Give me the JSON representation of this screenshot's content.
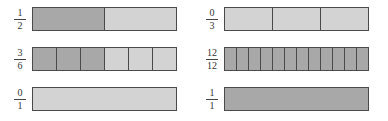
{
  "colors": {
    "shaded": "#a8a8a8",
    "unshaded": "#d3d3d3",
    "border": "#4a4a4a"
  },
  "fractions": [
    {
      "id": "one-half",
      "numerator": "1",
      "denominator": "2",
      "parts": 2,
      "shaded": 1,
      "col": 0,
      "row": 0
    },
    {
      "id": "zero-thirds",
      "numerator": "0",
      "denominator": "3",
      "parts": 3,
      "shaded": 0,
      "col": 1,
      "row": 0
    },
    {
      "id": "three-sixths",
      "numerator": "3",
      "denominator": "6",
      "parts": 6,
      "shaded": 3,
      "col": 0,
      "row": 1
    },
    {
      "id": "twelve-twelfths",
      "numerator": "12",
      "denominator": "12",
      "parts": 12,
      "shaded": 12,
      "col": 1,
      "row": 1
    },
    {
      "id": "zero-ones",
      "numerator": "0",
      "denominator": "1",
      "parts": 1,
      "shaded": 0,
      "col": 0,
      "row": 2
    },
    {
      "id": "one-one",
      "numerator": "1",
      "denominator": "1",
      "parts": 1,
      "shaded": 1,
      "col": 1,
      "row": 2
    }
  ]
}
